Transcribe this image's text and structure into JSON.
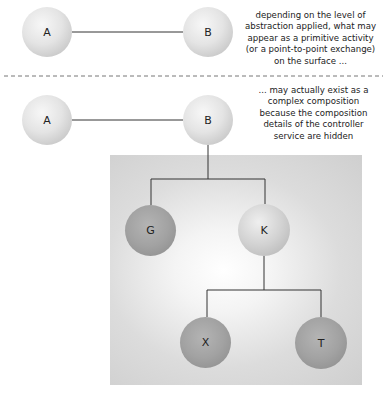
{
  "diagram": {
    "top_section": {
      "nodes": [
        {
          "id": "A",
          "label": "A"
        },
        {
          "id": "B",
          "label": "B"
        }
      ],
      "edges": [
        {
          "from": "A",
          "to": "B"
        }
      ],
      "note": [
        "depending on the level of",
        "abstraction applied, what may",
        "appear as a primitive activity",
        "(or a point-to-point exchange)",
        "on the surface ..."
      ]
    },
    "bottom_section": {
      "nodes": [
        {
          "id": "A",
          "label": "A"
        },
        {
          "id": "B",
          "label": "B"
        },
        {
          "id": "G",
          "label": "G"
        },
        {
          "id": "K",
          "label": "K"
        },
        {
          "id": "X",
          "label": "X"
        },
        {
          "id": "T",
          "label": "T"
        }
      ],
      "edges": [
        {
          "from": "A",
          "to": "B"
        },
        {
          "from": "B",
          "to": "G"
        },
        {
          "from": "B",
          "to": "K"
        },
        {
          "from": "K",
          "to": "X"
        },
        {
          "from": "K",
          "to": "T"
        }
      ],
      "note": [
        "... may actually exist as a",
        "complex composition",
        "because the composition",
        "details of the controller",
        "service are hidden"
      ]
    }
  }
}
